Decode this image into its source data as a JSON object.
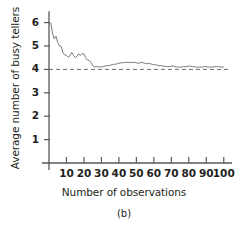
{
  "chart_data": {
    "type": "line",
    "title": "",
    "subtitle": "",
    "caption": "(b)",
    "xlabel": "Number of observations",
    "ylabel": "Average number of busy tellers",
    "xlim": [
      0,
      103
    ],
    "ylim": [
      0,
      6.4
    ],
    "xticks": [
      10,
      20,
      30,
      40,
      50,
      60,
      70,
      80,
      90,
      100
    ],
    "xtick_labels": [
      "10",
      "20",
      "30",
      "40",
      "50",
      "60",
      "70",
      "80",
      "90",
      "100"
    ],
    "yticks": [
      1,
      2,
      3,
      4,
      5,
      6
    ],
    "ytick_labels": [
      "1",
      "2",
      "3",
      "4",
      "5",
      "6"
    ],
    "grid": false,
    "legend": false,
    "legend_position": "none",
    "line_color": "#7a7a7a",
    "reference_line": {
      "name": "steady-state mean",
      "orientation": "horizontal",
      "y": 4.0,
      "style": "dashed",
      "color": "#6b6b6b",
      "x_start": 0,
      "x_end": 103
    },
    "series": [
      {
        "name": "Average number of busy tellers",
        "x": [
          1,
          2,
          3,
          4,
          5,
          6,
          7,
          8,
          9,
          10,
          11,
          12,
          13,
          14,
          15,
          16,
          17,
          18,
          19,
          20,
          21,
          22,
          23,
          24,
          25,
          26,
          27,
          28,
          29,
          30,
          31,
          32,
          33,
          34,
          35,
          36,
          37,
          38,
          39,
          40,
          41,
          42,
          43,
          44,
          45,
          46,
          47,
          48,
          49,
          50,
          51,
          52,
          53,
          54,
          55,
          56,
          57,
          58,
          59,
          60,
          61,
          62,
          63,
          64,
          65,
          66,
          67,
          68,
          69,
          70,
          71,
          72,
          73,
          74,
          75,
          76,
          77,
          78,
          79,
          80,
          81,
          82,
          83,
          84,
          85,
          86,
          87,
          88,
          89,
          90,
          91,
          92,
          93,
          94,
          95,
          96,
          97,
          98,
          99,
          100
        ],
        "y": [
          6.0,
          5.55,
          5.3,
          5.42,
          5.15,
          5.0,
          4.98,
          4.7,
          4.62,
          4.6,
          4.52,
          4.58,
          4.72,
          4.6,
          4.5,
          4.56,
          4.66,
          4.6,
          4.68,
          4.66,
          4.5,
          4.4,
          4.38,
          4.3,
          4.18,
          4.1,
          4.12,
          4.1,
          4.12,
          4.1,
          4.12,
          4.14,
          4.16,
          4.16,
          4.18,
          4.2,
          4.22,
          4.22,
          4.24,
          4.26,
          4.28,
          4.28,
          4.3,
          4.3,
          4.3,
          4.3,
          4.3,
          4.3,
          4.3,
          4.28,
          4.26,
          4.28,
          4.3,
          4.28,
          4.26,
          4.24,
          4.26,
          4.24,
          4.22,
          4.2,
          4.2,
          4.18,
          4.16,
          4.16,
          4.14,
          4.14,
          4.12,
          4.12,
          4.12,
          4.14,
          4.14,
          4.12,
          4.1,
          4.1,
          4.1,
          4.1,
          4.12,
          4.12,
          4.12,
          4.14,
          4.14,
          4.12,
          4.12,
          4.1,
          4.1,
          4.1,
          4.1,
          4.1,
          4.12,
          4.12,
          4.1,
          4.1,
          4.1,
          4.1,
          4.12,
          4.12,
          4.12,
          4.1,
          4.1,
          4.1
        ]
      }
    ]
  }
}
